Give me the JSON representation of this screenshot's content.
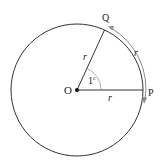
{
  "diagram": {
    "type": "geometry",
    "labels": {
      "center": "O",
      "point_p": "P",
      "point_q": "Q",
      "radius_op": "r",
      "radius_oq": "r",
      "arc_pq": "r",
      "angle": "1",
      "angle_unit": "c"
    },
    "colors": {
      "stroke": "#333333",
      "arc_arrow": "#8a8a8a",
      "text": "#222222"
    }
  }
}
